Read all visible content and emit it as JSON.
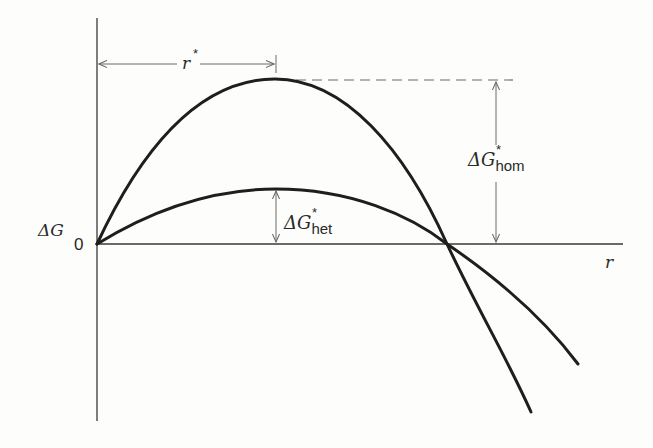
{
  "diagram": {
    "type": "free-energy-vs-radius",
    "axes": {
      "y_label": "ΔG",
      "x_label": "r",
      "origin_label": "0"
    },
    "annotations": {
      "critical_radius": {
        "label": "r",
        "superscript": "*"
      },
      "homogeneous_barrier": {
        "label": "ΔG",
        "superscript": "*",
        "subscript": "hom"
      },
      "heterogeneous_barrier": {
        "label": "ΔG",
        "superscript": "*",
        "subscript": "het"
      }
    },
    "curves": [
      {
        "name": "homogeneous",
        "description": "tall parabola-like curve peaking at r*, crossing zero then falling steeply"
      },
      {
        "name": "heterogeneous",
        "description": "lower curve peaking at r*, crossing zero at same point then falling less steeply"
      }
    ],
    "colors": {
      "curve": "#1e1e1e",
      "axis": "#3a3a3a",
      "annotation": "#6a6a6a"
    }
  }
}
